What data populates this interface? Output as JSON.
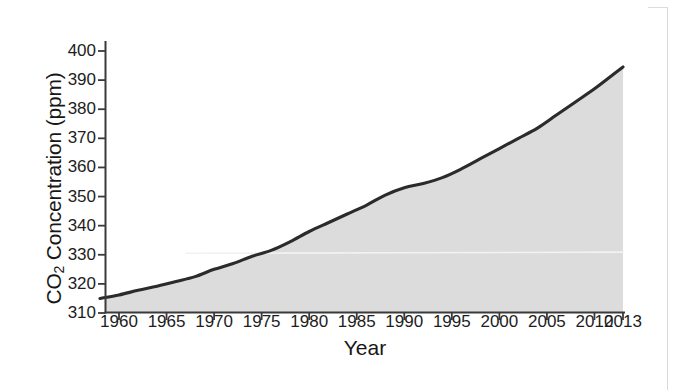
{
  "figure": {
    "background_color": "#ffffff",
    "area_fill_color": "#dcdcdc",
    "line_color": "#2b2b2b",
    "axis_color": "#3a3a3a"
  },
  "chart_data": {
    "type": "area",
    "title": "",
    "xlabel": "Year",
    "ylabel": "CO2 Concentration (ppm)",
    "ylabel_rich": {
      "prefix": "CO",
      "subscript": "2",
      "suffix": " Concentration (ppm)"
    },
    "xlim": [
      1958,
      2013
    ],
    "ylim": [
      310,
      403
    ],
    "grid": false,
    "legend": null,
    "xticks": [
      1960,
      1965,
      1970,
      1975,
      1980,
      1985,
      1990,
      1995,
      2000,
      2005,
      2010,
      2013
    ],
    "xtick_labels": [
      "1960",
      "1965",
      "1970",
      "1975",
      "1980",
      "1985",
      "1990",
      "1995",
      "2000",
      "2005",
      "2010",
      "2013"
    ],
    "yticks": [
      310,
      320,
      330,
      340,
      350,
      360,
      370,
      380,
      390,
      400
    ],
    "ytick_labels": [
      "310",
      "320",
      "330",
      "340",
      "350",
      "360",
      "370",
      "380",
      "390",
      "400"
    ],
    "x": [
      1958,
      1960,
      1962,
      1964,
      1966,
      1968,
      1970,
      1972,
      1974,
      1976,
      1978,
      1980,
      1982,
      1984,
      1986,
      1988,
      1990,
      1992,
      1994,
      1996,
      1998,
      2000,
      2002,
      2004,
      2006,
      2008,
      2010,
      2012,
      2013
    ],
    "values": [
      315.0,
      316.2,
      317.8,
      319.2,
      320.8,
      322.5,
      325.0,
      327.0,
      329.5,
      331.5,
      334.5,
      338.0,
      341.0,
      344.0,
      347.0,
      350.5,
      353.0,
      354.5,
      356.5,
      359.5,
      363.0,
      366.5,
      370.0,
      373.5,
      378.0,
      382.5,
      387.0,
      392.0,
      394.5
    ],
    "annotations": [
      {
        "name": "scan-artifact-line",
        "type": "horizontal-line",
        "y": 330.5,
        "color": "#f2f2f2"
      }
    ]
  }
}
